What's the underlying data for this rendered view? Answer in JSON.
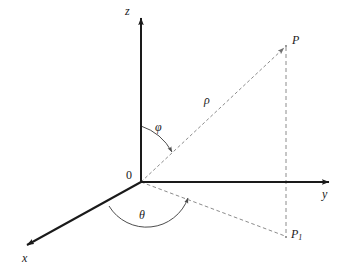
{
  "figure": {
    "background_color": "#ffffff",
    "axis_color": "#1a1a1a",
    "dashed_color": "#8c8c8c",
    "arc_color": "#4d4d4d",
    "text_color": "#1a1a1a"
  },
  "axes": [
    {
      "key": "z",
      "label": "z",
      "from": [
        141,
        182
      ],
      "to": [
        141,
        16
      ],
      "label_pos": [
        126,
        6
      ]
    },
    {
      "key": "y",
      "label": "y",
      "from": [
        141,
        182
      ],
      "to": [
        332,
        182
      ],
      "label_pos": [
        322,
        188
      ]
    },
    {
      "key": "x",
      "label": "x",
      "from": [
        141,
        182
      ],
      "to": [
        24,
        246
      ],
      "label_pos": [
        22,
        252
      ]
    }
  ],
  "origin": {
    "label": "0",
    "point": [
      141,
      182
    ],
    "label_pos": [
      126,
      169
    ]
  },
  "points": [
    {
      "key": "P",
      "label": "P",
      "pos": [
        286,
        46
      ],
      "label_pos": [
        292,
        34
      ]
    },
    {
      "key": "P1",
      "label": "P",
      "sublabel": "1",
      "pos": [
        286,
        237
      ],
      "label_pos": [
        291,
        228
      ]
    }
  ],
  "segments": [
    {
      "key": "rho-line",
      "style": "dashed",
      "from": [
        141,
        182
      ],
      "to": [
        286,
        46
      ],
      "label": "ρ",
      "label_pos": [
        204,
        94
      ]
    },
    {
      "key": "p-to-p1",
      "style": "dashed",
      "from": [
        286,
        46
      ],
      "to": [
        286,
        237
      ],
      "label": "",
      "label_pos": [
        0,
        0
      ]
    },
    {
      "key": "o-to-p1",
      "style": "dashed",
      "from": [
        141,
        182
      ],
      "to": [
        286,
        237
      ],
      "label": "",
      "label_pos": [
        0,
        0
      ]
    }
  ],
  "angles": [
    {
      "key": "phi",
      "label": "φ",
      "description": "polar angle from positive z-axis to ray OP",
      "arc_path": "M 141 126 A 56 56 0 0 1 174 153",
      "label_pos": [
        155,
        121
      ]
    },
    {
      "key": "theta",
      "label": "θ",
      "description": "azimuthal angle from positive x-axis to ray OP1",
      "arc_path": "M 109 206 A 44 44 0 0 0 190 197",
      "label_pos": [
        139,
        209
      ]
    }
  ]
}
